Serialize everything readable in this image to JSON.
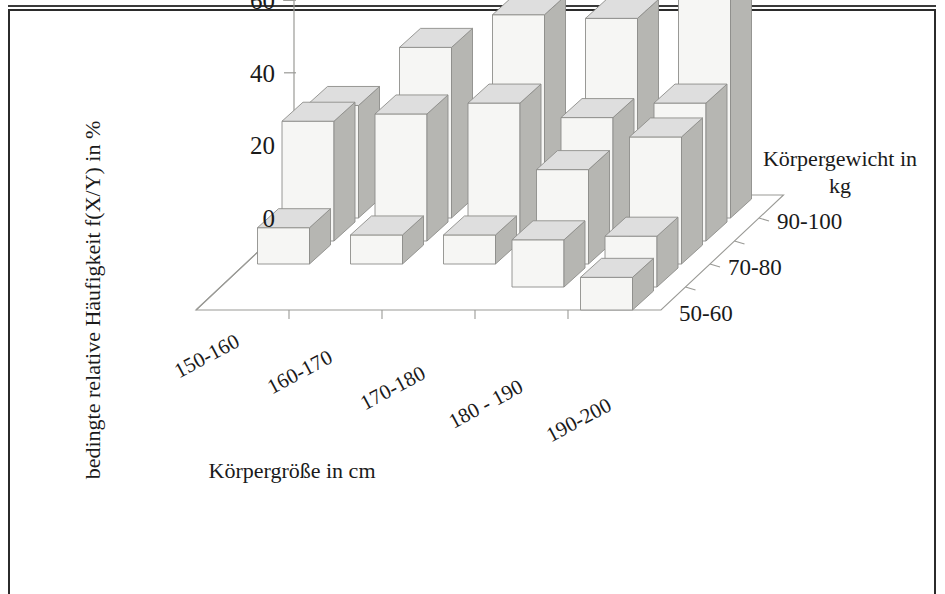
{
  "chart_data": {
    "type": "bar",
    "subtype": "3d-bar",
    "title": "",
    "xlabel": "Körpergröße in cm",
    "ylabel": "bedingte relative Häufigkeit f(X/Y) in %",
    "zlabel": "Körpergewicht in kg",
    "ylim": [
      0,
      60
    ],
    "yticks": [
      0,
      20,
      40,
      60
    ],
    "grid": false,
    "legend_position": "right-depth-axis",
    "categories": [
      "150-160",
      "160-170",
      "170-180",
      "180 - 190",
      "190-200"
    ],
    "series": [
      {
        "name": "90-100",
        "label_shown": true,
        "values": [
          31,
          47,
          56,
          55,
          69
        ]
      },
      {
        "name": "80-90",
        "label_shown": false,
        "values": [
          33,
          35,
          38,
          34,
          38
        ]
      },
      {
        "name": "70-80",
        "label_shown": true,
        "values": [
          10,
          8,
          8,
          26,
          35
        ]
      },
      {
        "name": "60-70",
        "label_shown": false,
        "values": [
          0,
          0,
          0,
          13,
          14
        ]
      },
      {
        "name": "50-60",
        "label_shown": true,
        "values": [
          0,
          0,
          0,
          0,
          9
        ]
      }
    ],
    "series_labels_visible": [
      "90-100",
      "70-80",
      "50-60"
    ]
  },
  "axes": {
    "y_tick_labels": [
      "60",
      "40",
      "20",
      "0"
    ],
    "y_axis_title": "bedingte relative Häufigkeit f(X/Y) in %",
    "x_axis_title": "Körpergröße in cm",
    "z_axis_title_line1": "Körpergewicht in",
    "z_axis_title_line2": "kg",
    "x_tick_labels": [
      "150-160",
      "160-170",
      "170-180",
      "180 - 190",
      "190-200"
    ],
    "z_tick_labels": [
      "90-100",
      "70-80",
      "50-60"
    ]
  },
  "colors": {
    "bar_front": "#f6f6f4",
    "bar_side": "#b6b6b2",
    "bar_top": "#dedede",
    "bar_edge": "#8d8d8a",
    "axis_line": "#9a9a96",
    "text": "#1a1a1a",
    "frame": "#2b2b2b",
    "background": "#ffffff"
  }
}
